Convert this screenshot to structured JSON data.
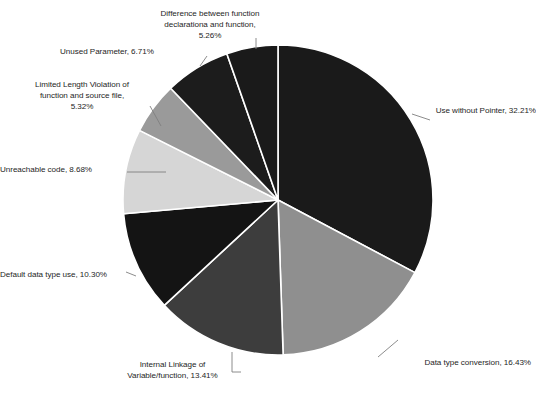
{
  "chart_data": {
    "type": "pie",
    "title": "",
    "subtitle": "",
    "xlabel": "",
    "ylabel": "",
    "legend_position": "none",
    "grid": false,
    "start_angle_deg": 0,
    "direction": "clockwise",
    "units": "percent",
    "categories": [
      "Use without Pointer",
      "Data type conversion",
      "Internal Linkage of Variable/function",
      "Default data type use",
      "Unreachable code",
      "Limited Length Violation of function and source file",
      "Unused Parameter",
      "Difference between function declarationa and function"
    ],
    "values": [
      32.21,
      16.43,
      13.41,
      10.3,
      8.68,
      5.32,
      6.71,
      5.26
    ],
    "colors": [
      "#1a1a1a",
      "#8f8f8f",
      "#3d3d3d",
      "#141414",
      "#d6d6d6",
      "#9a9a9a",
      "#1c1c1c",
      "#1a1a1a"
    ],
    "slice_border_color": "#ffffff",
    "leader_line_color": "#7f7f7f",
    "slices": [
      {
        "name": "Use without Pointer",
        "value": 32.21,
        "label": "Use without Pointer, 32.21%",
        "color": "#1a1a1a"
      },
      {
        "name": "Data type conversion",
        "value": 16.43,
        "label": "Data type conversion, 16.43%",
        "color": "#8f8f8f"
      },
      {
        "name": "Internal Linkage of Variable/function",
        "value": 13.41,
        "label": "Internal Linkage of\nVariable/function, 13.41%",
        "color": "#3d3d3d"
      },
      {
        "name": "Default data type use",
        "value": 10.3,
        "label": "Default data type use, 10.30%",
        "color": "#141414"
      },
      {
        "name": "Unreachable code",
        "value": 8.68,
        "label": "Unreachable code, 8.68%",
        "color": "#d6d6d6"
      },
      {
        "name": "Limited Length Violation of function and source file",
        "value": 5.32,
        "label": "Limited Length Violation of\nfunction and source file,\n5.32%",
        "color": "#9a9a9a"
      },
      {
        "name": "Unused Parameter",
        "value": 6.71,
        "label": "Unused Parameter, 6.71%",
        "color": "#1c1c1c"
      },
      {
        "name": "Difference between function declarationa and function",
        "value": 5.26,
        "label": "Difference between function\ndeclarationa and function,\n5.26%",
        "color": "#1a1a1a"
      }
    ]
  }
}
